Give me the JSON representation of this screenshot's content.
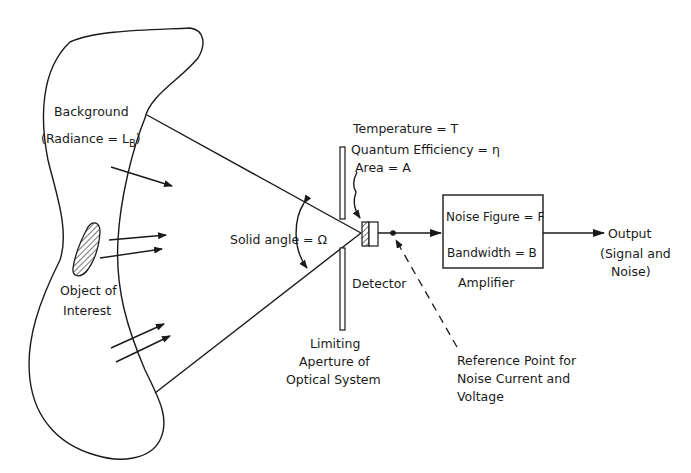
{
  "figure": {
    "background": {
      "label": "Background",
      "radiance_prefix": "(Radiance = L",
      "radiance_sub": "B",
      "radiance_suffix": ")"
    },
    "object": {
      "line1": "Object of",
      "line2": "Interest"
    },
    "solid_angle": {
      "label": "Solid angle = Ω"
    },
    "detector_params": {
      "temperature": "Temperature = T",
      "quantum_efficiency": "Quantum Efficiency = η",
      "area": "Area = A"
    },
    "detector": {
      "label": "Detector"
    },
    "aperture": {
      "line1": "Limiting",
      "line2": "Aperture of",
      "line3": "Optical System"
    },
    "amplifier": {
      "noise_figure": "Noise Figure = F",
      "bandwidth": "Bandwidth = B",
      "label": "Amplifier"
    },
    "output": {
      "line1": "Output",
      "line2": "(Signal and",
      "line3": "Noise)"
    },
    "reference_point": {
      "line1": "Reference Point for",
      "line2": "Noise Current and",
      "line3": "Voltage"
    },
    "colors": {
      "ink": "#1a1a1a",
      "paper": "#ffffff"
    }
  }
}
